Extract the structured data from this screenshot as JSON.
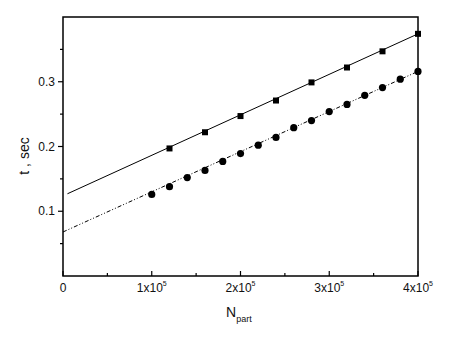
{
  "chart_data": {
    "type": "scatter",
    "title": "",
    "xlabel": "N",
    "xlabel_subscript": "part",
    "ylabel": "t , sec",
    "xlim": [
      0,
      400000
    ],
    "ylim": [
      0,
      0.4
    ],
    "grid": false,
    "legend": null,
    "x_ticks": [
      {
        "value": 0,
        "label": "0"
      },
      {
        "value": 100000,
        "label": "1x10",
        "exp": "5"
      },
      {
        "value": 200000,
        "label": "2x10",
        "exp": "5"
      },
      {
        "value": 300000,
        "label": "3x10",
        "exp": "5"
      },
      {
        "value": 400000,
        "label": "4x10",
        "exp": "5"
      }
    ],
    "x_minor_ticks": [
      50000,
      150000,
      250000,
      350000
    ],
    "y_ticks": [
      {
        "value": 0.1,
        "label": "0.1"
      },
      {
        "value": 0.2,
        "label": "0.2"
      },
      {
        "value": 0.3,
        "label": "0.3"
      }
    ],
    "y_minor_ticks": [
      0.05,
      0.15,
      0.25,
      0.35
    ],
    "series": [
      {
        "name": "squares",
        "marker": "square",
        "line_style": "solid",
        "color": "#000000",
        "x": [
          120000,
          160000,
          200000,
          240000,
          280000,
          320000,
          360000,
          400000
        ],
        "y": [
          0.197,
          0.222,
          0.247,
          0.271,
          0.299,
          0.322,
          0.347,
          0.374
        ],
        "fit_line": {
          "x": [
            5000,
            400000
          ],
          "y": [
            0.127,
            0.374
          ]
        }
      },
      {
        "name": "circles",
        "marker": "circle",
        "line_style": "dash-dot-dot",
        "color": "#000000",
        "x": [
          100000,
          120000,
          140000,
          160000,
          180000,
          200000,
          220000,
          240000,
          260000,
          280000,
          300000,
          320000,
          340000,
          360000,
          380000,
          400000
        ],
        "y": [
          0.126,
          0.138,
          0.152,
          0.163,
          0.177,
          0.189,
          0.202,
          0.214,
          0.229,
          0.24,
          0.254,
          0.265,
          0.279,
          0.291,
          0.304,
          0.316
        ],
        "fit_line": {
          "x": [
            0,
            400000
          ],
          "y": [
            0.068,
            0.316
          ]
        }
      }
    ]
  }
}
